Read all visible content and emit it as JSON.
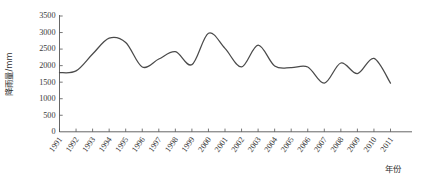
{
  "chart_data": {
    "type": "line",
    "title": "",
    "xlabel": "年份",
    "ylabel": "降雨量/mm",
    "grid": false,
    "legend": "none",
    "xlim": [
      1991,
      2011
    ],
    "ylim": [
      0,
      3500
    ],
    "yticks": [
      0,
      500,
      1000,
      1500,
      2000,
      2500,
      3000,
      3500
    ],
    "ytick_labels": [
      "0",
      "500",
      "1000",
      "1500",
      "2000",
      "2500",
      "3000",
      "3500"
    ],
    "categories": [
      "1991",
      "1992",
      "1993",
      "1994",
      "1995",
      "1996",
      "1997",
      "1998",
      "1999",
      "2000",
      "2001",
      "2002",
      "2003",
      "2004",
      "2005",
      "2006",
      "2007",
      "2008",
      "2009",
      "2010",
      "2011"
    ],
    "x": [
      1991,
      1992,
      1993,
      1994,
      1995,
      1996,
      1997,
      1998,
      1999,
      2000,
      2001,
      2002,
      2003,
      2004,
      2005,
      2006,
      2007,
      2008,
      2009,
      2010,
      2011
    ],
    "series": [
      {
        "name": "降雨量",
        "values": [
          1790,
          1840,
          2350,
          2830,
          2700,
          1960,
          2200,
          2420,
          2030,
          2980,
          2520,
          1960,
          2620,
          1990,
          1940,
          1960,
          1470,
          2080,
          1760,
          2220,
          1470
        ]
      }
    ],
    "line_color": "#4a4a4a",
    "axis_color": "#555555",
    "background_color": "#ffffff"
  },
  "axes": {
    "y_axis_caption": "降雨量/mm",
    "x_axis_caption": "年份"
  }
}
